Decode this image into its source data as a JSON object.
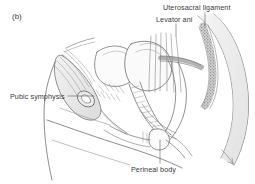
{
  "figure": {
    "panel_tag": "(b)",
    "type": "anatomical-line-drawing",
    "background_color": "#ffffff",
    "line_color": "#6e6e6e",
    "label_color": "#3b3b3b",
    "shading_color": "#d8d8d8",
    "labels": [
      {
        "id": "uterosacral",
        "text": "Uterosacral ligament"
      },
      {
        "id": "levator",
        "text": "Levator ani"
      },
      {
        "id": "pubic",
        "text": "Pubic symphysis"
      },
      {
        "id": "perineal",
        "text": "Perineal body"
      }
    ]
  }
}
